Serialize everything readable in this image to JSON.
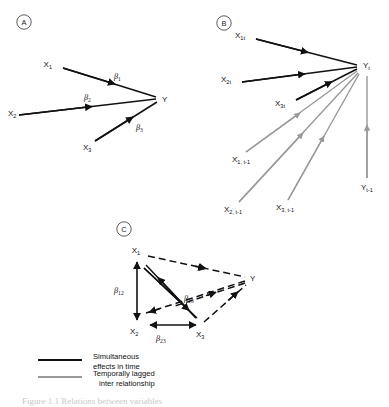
{
  "figure": {
    "background_color": "#ffffff",
    "solid_color": "#111111",
    "lagged_color": "#999999"
  },
  "panels": [
    {
      "letter": "A",
      "name": "simultaneous-effects-panel",
      "nodes": [
        {
          "id": "x1",
          "label": "X",
          "sub": "1"
        },
        {
          "id": "x2",
          "label": "X",
          "sub": "2"
        },
        {
          "id": "x3",
          "label": "X",
          "sub": "3"
        },
        {
          "id": "y",
          "label": "Y",
          "sub": ""
        }
      ],
      "coefficients": [
        {
          "id": "beta1",
          "symbol": "β",
          "sub": "1"
        },
        {
          "id": "beta2",
          "symbol": "β",
          "sub": "2"
        },
        {
          "id": "beta3",
          "symbol": "β",
          "sub": "3"
        }
      ]
    },
    {
      "letter": "B",
      "name": "temporally-lagged-panel",
      "nodes": [
        {
          "id": "x1t",
          "label": "X",
          "sub": "1t"
        },
        {
          "id": "x2t",
          "label": "X",
          "sub": "2t"
        },
        {
          "id": "x3t",
          "label": "X",
          "sub": "3t"
        },
        {
          "id": "yt",
          "label": "Y",
          "sub": "t"
        },
        {
          "id": "x1tm1",
          "label": "X",
          "sub": "1, t-1"
        },
        {
          "id": "x2tm1",
          "label": "X",
          "sub": "2, t-1"
        },
        {
          "id": "x3tm1",
          "label": "X",
          "sub": "3, t-1"
        },
        {
          "id": "ytm1",
          "label": "Y",
          "sub": "t-1"
        }
      ]
    },
    {
      "letter": "C",
      "name": "reciprocal-effects-panel",
      "nodes": [
        {
          "id": "x1",
          "label": "X",
          "sub": "1"
        },
        {
          "id": "x2",
          "label": "X",
          "sub": "2"
        },
        {
          "id": "x3",
          "label": "X",
          "sub": "3"
        },
        {
          "id": "y",
          "label": "Y",
          "sub": ""
        }
      ],
      "coefficients": [
        {
          "id": "beta12",
          "symbol": "β",
          "sub": "12"
        },
        {
          "id": "beta13",
          "symbol": "β",
          "sub": "13"
        },
        {
          "id": "beta23",
          "symbol": "β",
          "sub": "23"
        }
      ]
    }
  ],
  "legend": {
    "name": "diagram-legend",
    "items": [
      {
        "id": "simultaneous",
        "color": "#111111",
        "line1": "Simultaneous",
        "line2": "effects in time"
      },
      {
        "id": "lagged",
        "color": "#999999",
        "line1": "Temporally lagged",
        "line2": "inter relationship"
      }
    ]
  },
  "caption": {
    "text": "Figure 1.1   Relations between variables"
  }
}
